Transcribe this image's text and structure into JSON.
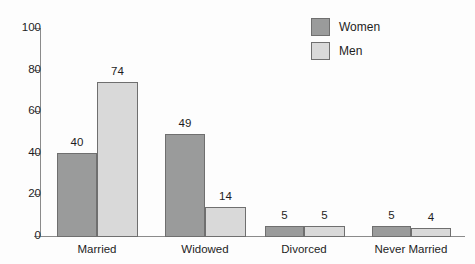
{
  "chart_data": {
    "type": "bar",
    "title": "",
    "xlabel": "",
    "ylabel": "",
    "ylim": [
      0,
      100
    ],
    "yticks": [
      0,
      20,
      40,
      60,
      80,
      100
    ],
    "grid": false,
    "legend_position": "top-right",
    "categories": [
      "Married",
      "Widowed",
      "Divorced",
      "Never Married"
    ],
    "series": [
      {
        "name": "Women",
        "color": "#9a9b9b",
        "values": [
          40,
          49,
          5,
          5
        ]
      },
      {
        "name": "Men",
        "color": "#d9d9d9",
        "values": [
          74,
          14,
          5,
          4
        ]
      }
    ]
  },
  "axis": {
    "ticks": [
      {
        "label": "100",
        "value": 100
      },
      {
        "label": "80",
        "value": 80
      },
      {
        "label": "60",
        "value": 60
      },
      {
        "label": "40",
        "value": 40
      },
      {
        "label": "20",
        "value": 20
      },
      {
        "label": "0",
        "value": 0
      }
    ]
  },
  "legend": {
    "items": [
      {
        "label": "Women",
        "swatch": "women"
      },
      {
        "label": "Men",
        "swatch": "men"
      }
    ]
  },
  "groups": [
    {
      "category": "Married",
      "center": 97,
      "bars": [
        {
          "series": "Women",
          "value": 40,
          "label": "40",
          "x": 57,
          "width": 40
        },
        {
          "series": "Men",
          "value": 74,
          "label": "74",
          "x": 97,
          "width": 41
        }
      ]
    },
    {
      "category": "Widowed",
      "center": 205,
      "bars": [
        {
          "series": "Women",
          "value": 49,
          "label": "49",
          "x": 165,
          "width": 40
        },
        {
          "series": "Men",
          "value": 14,
          "label": "14",
          "x": 205,
          "width": 41
        }
      ]
    },
    {
      "category": "Divorced",
      "center": 304,
      "bars": [
        {
          "series": "Women",
          "value": 5,
          "label": "5",
          "x": 265,
          "width": 39
        },
        {
          "series": "Men",
          "value": 5,
          "label": "5",
          "x": 304,
          "width": 41
        }
      ]
    },
    {
      "category": "Never Married",
      "center": 411,
      "bars": [
        {
          "series": "Women",
          "value": 5,
          "label": "5",
          "x": 372,
          "width": 39
        },
        {
          "series": "Men",
          "value": 4,
          "label": "4",
          "x": 411,
          "width": 40
        }
      ]
    }
  ]
}
